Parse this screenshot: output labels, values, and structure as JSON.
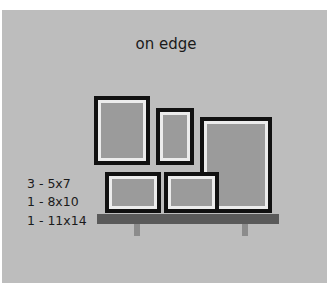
{
  "title": "on edge",
  "legend": [
    {
      "qty": "3",
      "size": "5x7",
      "label": "3 - 5x7"
    },
    {
      "qty": "1",
      "size": "8x10",
      "label": "1 - 8x10"
    },
    {
      "qty": "1",
      "size": "11x14",
      "label": "1 - 11x14"
    }
  ],
  "frames": [
    {
      "id": "8x10-portrait",
      "size": "8x10",
      "orientation": "portrait",
      "x": 94,
      "y": 96,
      "w": 56,
      "h": 69
    },
    {
      "id": "5x7-portrait",
      "size": "5x7",
      "orientation": "portrait",
      "x": 156,
      "y": 108,
      "w": 38,
      "h": 57
    },
    {
      "id": "11x14-portrait",
      "size": "11x14",
      "orientation": "portrait",
      "x": 200,
      "y": 117,
      "w": 72,
      "h": 96
    },
    {
      "id": "5x7-landscape-left",
      "size": "5x7",
      "orientation": "landscape",
      "x": 105,
      "y": 172,
      "w": 56,
      "h": 41
    },
    {
      "id": "5x7-landscape-right",
      "size": "5x7",
      "orientation": "landscape",
      "x": 164,
      "y": 172,
      "w": 55,
      "h": 41
    }
  ],
  "shelf": {
    "x": 97,
    "y": 214,
    "w": 182,
    "h": 10
  },
  "brackets": [
    {
      "x": 134,
      "y": 224,
      "w": 6,
      "h": 12
    },
    {
      "x": 242,
      "y": 224,
      "w": 6,
      "h": 12
    }
  ],
  "colors": {
    "background": "#bdbdbd",
    "frame_border": "#111111",
    "mat": "#ececec",
    "picture": "#9b9b9b",
    "shelf": "#5a5a5a",
    "bracket": "#8c8c8c",
    "text": "#1a1a1a"
  }
}
